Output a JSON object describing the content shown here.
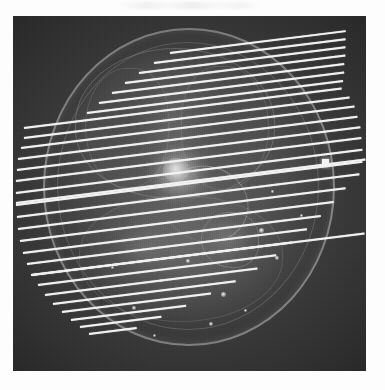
{
  "view": {
    "title": "Axial scan slice planning view",
    "modality_label": "CT / MR axial localizer",
    "background_color": "#fdfdfd",
    "scan_background_color": "#393939",
    "overlay_color": "#f2f2f2",
    "marker_color": "#f4f4f4"
  },
  "scan_viewport": {
    "left": 13,
    "top": 16,
    "width": 353,
    "height": 355
  },
  "annotations": {
    "top_artifact_present": true
  },
  "fiducial_marker": {
    "label": "bright fiducial marker",
    "x": 309,
    "y": 143,
    "width": 7,
    "height": 8
  },
  "anatomy_foci": [
    {
      "x": 246,
      "y": 212,
      "size": 5
    },
    {
      "x": 208,
      "y": 276,
      "size": 5
    },
    {
      "x": 173,
      "y": 243,
      "size": 4
    },
    {
      "x": 262,
      "y": 240,
      "size": 4
    },
    {
      "x": 119,
      "y": 290,
      "size": 4
    },
    {
      "x": 196,
      "y": 306,
      "size": 4
    },
    {
      "x": 147,
      "y": 263,
      "size": 3
    },
    {
      "x": 287,
      "y": 198,
      "size": 3
    },
    {
      "x": 98,
      "y": 250,
      "size": 3
    },
    {
      "x": 231,
      "y": 293,
      "size": 3
    },
    {
      "x": 140,
      "y": 318,
      "size": 3
    },
    {
      "x": 258,
      "y": 174,
      "size": 3
    }
  ],
  "slice_plan": {
    "name": "parallel-slice-group",
    "count": 20,
    "angle_degrees": -7.1,
    "spacing_px": 13,
    "lines": [
      {
        "index": 1,
        "x": 11,
        "y": 121,
        "length": 328
      },
      {
        "index": 2,
        "x": 8,
        "y": 131,
        "length": 336
      },
      {
        "index": 3,
        "x": 5,
        "y": 142,
        "length": 342
      },
      {
        "index": 4,
        "x": 4,
        "y": 153,
        "length": 346
      },
      {
        "index": 5,
        "x": 3,
        "y": 164,
        "length": 348
      },
      {
        "index": 6,
        "x": 3,
        "y": 176,
        "length": 349
      },
      {
        "index": 7,
        "x": 3,
        "y": 188,
        "length": 349
      },
      {
        "index": 8,
        "x": 4,
        "y": 200,
        "length": 345
      },
      {
        "index": 9,
        "x": 5,
        "y": 212,
        "length": 330
      },
      {
        "index": 10,
        "x": 7,
        "y": 224,
        "length": 316
      },
      {
        "index": 11,
        "x": 10,
        "y": 236,
        "length": 300
      },
      {
        "index": 12,
        "x": 14,
        "y": 247,
        "length": 282
      },
      {
        "index": 13,
        "x": 19,
        "y": 258,
        "length": 262
      },
      {
        "index": 14,
        "x": 25,
        "y": 268,
        "length": 240
      },
      {
        "index": 15,
        "x": 32,
        "y": 278,
        "length": 214
      },
      {
        "index": 16,
        "x": 40,
        "y": 287,
        "length": 184
      },
      {
        "index": 17,
        "x": 49,
        "y": 295,
        "length": 150
      },
      {
        "index": 18,
        "x": 58,
        "y": 303,
        "length": 116
      },
      {
        "index": 19,
        "x": 67,
        "y": 310,
        "length": 82
      },
      {
        "index": 20,
        "x": 76,
        "y": 317,
        "length": 48
      }
    ],
    "extended_lines": [
      {
        "index": 21,
        "x": 3,
        "y": 186,
        "length": 352
      },
      {
        "index": 22,
        "x": 18,
        "y": 258,
        "length": 336
      }
    ],
    "upper_lines": [
      {
        "index": 0,
        "x": 11,
        "y": 111,
        "length": 320
      },
      {
        "index": -1,
        "x": 74,
        "y": 96,
        "length": 258
      },
      {
        "index": -2,
        "x": 86,
        "y": 86,
        "length": 247
      },
      {
        "index": -3,
        "x": 99,
        "y": 76,
        "length": 234
      },
      {
        "index": -4,
        "x": 112,
        "y": 66,
        "length": 222
      },
      {
        "index": -5,
        "x": 126,
        "y": 56,
        "length": 208
      },
      {
        "index": -6,
        "x": 141,
        "y": 46,
        "length": 193
      },
      {
        "index": -7,
        "x": 157,
        "y": 36,
        "length": 177
      }
    ]
  }
}
